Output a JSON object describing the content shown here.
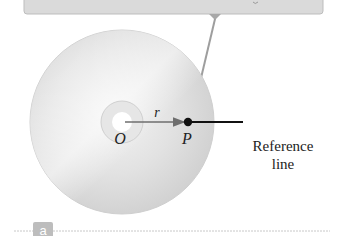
{
  "diagram": {
    "labels": {
      "center": "O",
      "point": "P",
      "radius": "r",
      "reference_line_1": "Reference",
      "reference_line_2": "line",
      "panel": "a"
    },
    "colors": {
      "callout_box": "#d9d9d9",
      "callout_border": "#bdbdbd",
      "disc": "#dcdcdc",
      "disc_highlight": "#f2f2f2",
      "leader_line": "#9e9e9e",
      "arrow": "#6e6e6e",
      "point": "#111111",
      "panel_badge": "#bdbdbd",
      "divider": "#c8c8c8"
    }
  }
}
